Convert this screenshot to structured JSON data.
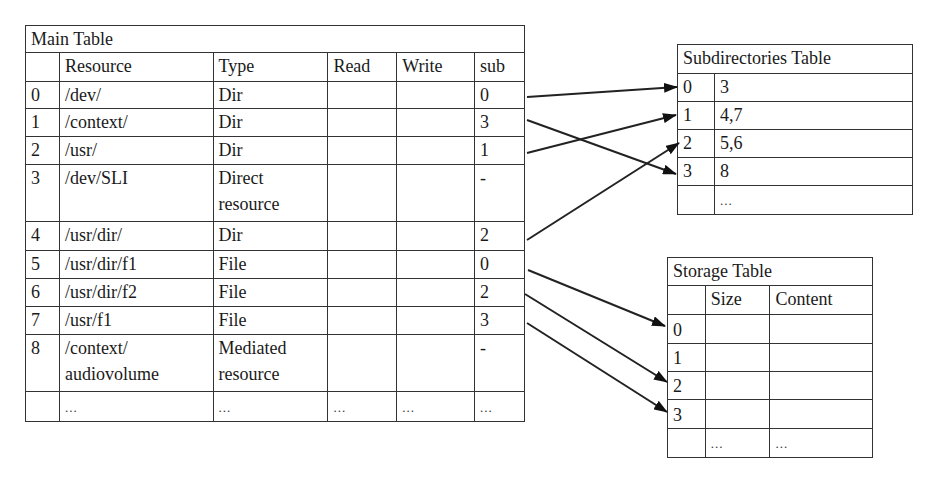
{
  "main_table": {
    "title": "Main Table",
    "headers": [
      "",
      "Resource",
      "Type",
      "Read",
      "Write",
      "sub"
    ],
    "rows": [
      {
        "idx": "0",
        "resource": "/dev/",
        "type": "Dir",
        "read": "",
        "write": "",
        "sub": "0"
      },
      {
        "idx": "1",
        "resource": "/context/",
        "type": "Dir",
        "read": "",
        "write": "",
        "sub": "3"
      },
      {
        "idx": "2",
        "resource": "/usr/",
        "type": "Dir",
        "read": "",
        "write": "",
        "sub": "1"
      },
      {
        "idx": "3",
        "resource": "/dev/SLI",
        "type": "Direct",
        "type2": "resource",
        "read": "",
        "write": "",
        "sub": "-"
      },
      {
        "idx": "4",
        "resource": "/usr/dir/",
        "type": "Dir",
        "read": "",
        "write": "",
        "sub": "2"
      },
      {
        "idx": "5",
        "resource": "/usr/dir/f1",
        "type": "File",
        "read": "",
        "write": "",
        "sub": "0"
      },
      {
        "idx": "6",
        "resource": "/usr/dir/f2",
        "type": "File",
        "read": "",
        "write": "",
        "sub": "2"
      },
      {
        "idx": "7",
        "resource": "/usr/f1",
        "type": "File",
        "read": "",
        "write": "",
        "sub": "3"
      },
      {
        "idx": "8",
        "resource": "/context/",
        "resource2": "audiovolume",
        "type": "Mediated",
        "type2": "resource",
        "read": "",
        "write": "",
        "sub": "-"
      },
      {
        "idx": "",
        "resource": "...",
        "type": "...",
        "read": "...",
        "write": "...",
        "sub": "..."
      }
    ]
  },
  "subdirectories_table": {
    "title": "Subdirectories Table",
    "rows": [
      {
        "idx": "0",
        "value": "3"
      },
      {
        "idx": "1",
        "value": "4,7"
      },
      {
        "idx": "2",
        "value": "5,6"
      },
      {
        "idx": "3",
        "value": "8"
      },
      {
        "idx": "",
        "value": "..."
      }
    ]
  },
  "storage_table": {
    "title": "Storage Table",
    "headers": [
      "",
      "Size",
      "Content"
    ],
    "rows": [
      {
        "idx": "0",
        "size": "",
        "content": ""
      },
      {
        "idx": "1",
        "size": "",
        "content": ""
      },
      {
        "idx": "2",
        "size": "",
        "content": ""
      },
      {
        "idx": "3",
        "size": "",
        "content": ""
      },
      {
        "idx": "",
        "size": "...",
        "content": "..."
      }
    ]
  },
  "arrows": [
    {
      "from": "main.0.sub",
      "to": "subdirectories.0"
    },
    {
      "from": "main.1.sub",
      "to": "subdirectories.3"
    },
    {
      "from": "main.2.sub",
      "to": "subdirectories.1"
    },
    {
      "from": "main.4.sub",
      "to": "subdirectories.2"
    },
    {
      "from": "main.5.sub",
      "to": "storage.0"
    },
    {
      "from": "main.6.sub",
      "to": "storage.2"
    },
    {
      "from": "main.7.sub",
      "to": "storage.3"
    }
  ],
  "colors": {
    "line": "#333333",
    "background": "#ffffff",
    "text": "#1a1a1a"
  }
}
